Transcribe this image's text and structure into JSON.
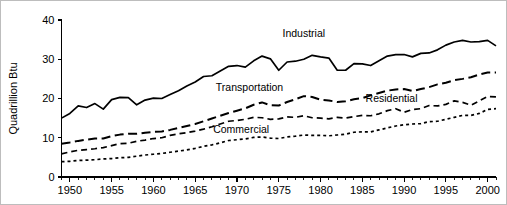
{
  "chart_data": {
    "type": "line",
    "title": "",
    "xlabel": "",
    "ylabel": "Quadrillion Btu",
    "xlim": [
      1949,
      2001
    ],
    "ylim": [
      0,
      40
    ],
    "grid": false,
    "legend_position": "inline-annotations",
    "ytick_labels": [
      "0",
      "10",
      "20",
      "30",
      "40"
    ],
    "ytick_values": [
      0,
      10,
      20,
      30,
      40
    ],
    "xtick_labels": [
      "1950",
      "1955",
      "1960",
      "1965",
      "1970",
      "1975",
      "1980",
      "1985",
      "1990",
      "1995",
      "2000"
    ],
    "xtick_values": [
      1950,
      1955,
      1960,
      1965,
      1970,
      1975,
      1980,
      1985,
      1990,
      1995,
      2000
    ],
    "x": [
      1949,
      1950,
      1951,
      1952,
      1953,
      1954,
      1955,
      1956,
      1957,
      1958,
      1959,
      1960,
      1961,
      1962,
      1963,
      1964,
      1965,
      1966,
      1967,
      1968,
      1969,
      1970,
      1971,
      1972,
      1973,
      1974,
      1975,
      1976,
      1977,
      1978,
      1979,
      1980,
      1981,
      1982,
      1983,
      1984,
      1985,
      1986,
      1987,
      1988,
      1989,
      1990,
      1991,
      1992,
      1993,
      1994,
      1995,
      1996,
      1997,
      1998,
      1999,
      2000,
      2001
    ],
    "series": [
      {
        "name": "Industrial",
        "style": "solid",
        "label_x": 1978.0,
        "label_y": 35.6,
        "values": [
          15.0,
          16.2,
          18.1,
          17.7,
          18.7,
          17.3,
          19.7,
          20.3,
          20.2,
          18.4,
          19.6,
          20.1,
          20.0,
          21.0,
          22.0,
          23.2,
          24.2,
          25.6,
          25.8,
          27.0,
          28.2,
          28.4,
          28.0,
          29.6,
          30.8,
          30.1,
          27.2,
          29.3,
          29.5,
          30.0,
          31.0,
          30.6,
          30.3,
          27.2,
          27.2,
          28.9,
          28.8,
          28.4,
          29.6,
          30.8,
          31.2,
          31.2,
          30.6,
          31.5,
          31.6,
          32.4,
          33.6,
          34.4,
          34.8,
          34.4,
          34.5,
          34.8,
          33.4
        ]
      },
      {
        "name": "Transportation",
        "style": "longdash",
        "label_x": 1971.5,
        "label_y": 22.0,
        "values": [
          8.5,
          8.8,
          9.2,
          9.5,
          9.8,
          9.8,
          10.4,
          10.8,
          11.0,
          11.0,
          11.3,
          11.5,
          11.6,
          12.0,
          12.5,
          13.0,
          13.5,
          14.2,
          14.9,
          15.6,
          16.3,
          16.9,
          17.5,
          18.4,
          19.0,
          18.3,
          18.2,
          19.1,
          19.8,
          20.6,
          20.4,
          19.7,
          19.5,
          19.1,
          19.3,
          19.8,
          20.1,
          20.8,
          21.4,
          22.0,
          22.3,
          22.4,
          21.9,
          22.4,
          22.9,
          23.6,
          24.0,
          24.7,
          25.0,
          25.4,
          26.1,
          26.6,
          26.6
        ]
      },
      {
        "name": "Residential",
        "style": "meddash",
        "label_x": 1988.5,
        "label_y": 19.2,
        "values": [
          5.9,
          6.4,
          6.8,
          7.0,
          7.2,
          7.5,
          8.0,
          8.5,
          8.6,
          9.1,
          9.4,
          9.8,
          10.0,
          10.6,
          11.0,
          11.3,
          11.7,
          12.2,
          12.8,
          13.5,
          14.2,
          14.4,
          14.7,
          15.2,
          15.1,
          14.7,
          14.8,
          15.3,
          15.2,
          15.6,
          15.1,
          15.0,
          14.8,
          15.2,
          15.0,
          15.4,
          15.7,
          15.6,
          16.1,
          16.9,
          17.4,
          16.5,
          17.2,
          17.4,
          18.2,
          18.1,
          18.5,
          19.4,
          19.0,
          18.3,
          19.4,
          20.5,
          20.4
        ]
      },
      {
        "name": "Commercial",
        "style": "shortdash",
        "label_x": 1970.5,
        "label_y": 11.2,
        "values": [
          3.9,
          4.0,
          4.2,
          4.3,
          4.4,
          4.6,
          4.7,
          4.9,
          5.0,
          5.3,
          5.6,
          5.8,
          6.0,
          6.3,
          6.6,
          6.9,
          7.3,
          7.8,
          8.2,
          8.7,
          9.3,
          9.5,
          9.7,
          10.1,
          10.2,
          9.9,
          9.8,
          10.2,
          10.4,
          10.7,
          10.6,
          10.6,
          10.5,
          10.7,
          10.9,
          11.4,
          11.5,
          11.5,
          12.0,
          12.5,
          13.0,
          13.3,
          13.5,
          13.6,
          14.1,
          14.2,
          14.7,
          15.2,
          15.7,
          15.7,
          16.2,
          17.2,
          17.4
        ]
      }
    ]
  }
}
